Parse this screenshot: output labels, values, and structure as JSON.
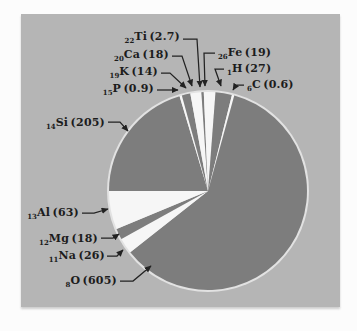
{
  "figure": {
    "page_color": "#fcfcfc",
    "panel_color": "#b5b5b5",
    "slice_dark_color": "#7d7d7d",
    "slice_light_color": "#f6f6f6",
    "pie_ring_color": "#e2e2e2",
    "leader_color": "#222222",
    "text_color": "#1c1c1c"
  },
  "chart_data": {
    "type": "pie",
    "title": "",
    "legend_position": "none",
    "start_angle_deg": 180,
    "direction": "clockwise",
    "label_format": "{atomic_number}{symbol} ({value})",
    "slices": [
      {
        "symbol": "Si",
        "atomic_number": "14",
        "value": "205",
        "shade": "dark"
      },
      {
        "symbol": "P",
        "atomic_number": "15",
        "value": "0.9",
        "shade": "light"
      },
      {
        "symbol": "K",
        "atomic_number": "19",
        "value": "14",
        "shade": "dark"
      },
      {
        "symbol": "Ca",
        "atomic_number": "20",
        "value": "18",
        "shade": "light"
      },
      {
        "symbol": "Ti",
        "atomic_number": "22",
        "value": "2.7",
        "shade": "dark"
      },
      {
        "symbol": "Fe",
        "atomic_number": "26",
        "value": "19",
        "shade": "light"
      },
      {
        "symbol": "H",
        "atomic_number": "1",
        "value": "27",
        "shade": "dark"
      },
      {
        "symbol": "C",
        "atomic_number": "6",
        "value": "0.6",
        "shade": "light"
      },
      {
        "symbol": "O",
        "atomic_number": "8",
        "value": "605",
        "shade": "dark"
      },
      {
        "symbol": "Na",
        "atomic_number": "11",
        "value": "26",
        "shade": "light"
      },
      {
        "symbol": "Mg",
        "atomic_number": "12",
        "value": "18",
        "shade": "dark"
      },
      {
        "symbol": "Al",
        "atomic_number": "13",
        "value": "63",
        "shade": "light"
      }
    ]
  }
}
